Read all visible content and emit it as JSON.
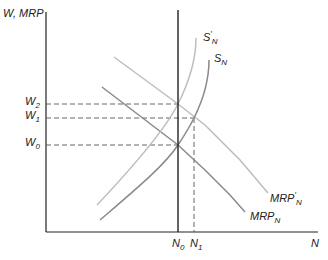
{
  "axes": {
    "y_label": "W, MRP",
    "x_label": "N"
  },
  "y_ticks": [
    {
      "id": "w2",
      "base": "W",
      "sub": "2"
    },
    {
      "id": "w1",
      "base": "W",
      "sub": "1"
    },
    {
      "id": "w0",
      "base": "W",
      "sub": "0"
    }
  ],
  "x_ticks": [
    {
      "id": "n0",
      "base": "N",
      "sub": "0"
    },
    {
      "id": "n1",
      "base": "N",
      "sub": "1"
    }
  ],
  "curves": {
    "s_prime": {
      "base": "S",
      "prime": "′",
      "sub": "N",
      "color": "#bdbdbd"
    },
    "s": {
      "base": "S",
      "sub": "N",
      "color": "#8a8a8a"
    },
    "mrp_prime": {
      "base": "MRP",
      "prime": "′",
      "sub": "N",
      "color": "#bdbdbd"
    },
    "mrp": {
      "base": "MRP",
      "sub": "N",
      "color": "#8a8a8a"
    }
  },
  "colors": {
    "axis": "#222222",
    "dashed": "#555555"
  }
}
